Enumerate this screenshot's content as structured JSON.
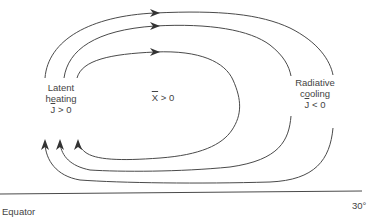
{
  "diagram": {
    "type": "meridional-circulation-schematic",
    "labels": {
      "latent": {
        "line1": "Latent",
        "line2": "heating",
        "symbol": "J",
        "relation": " > 0"
      },
      "radiative": {
        "line1": "Radiative",
        "line2": "cooling",
        "symbol": "J",
        "relation": " < 0"
      },
      "interior": {
        "symbol": "X",
        "relation": " > 0"
      }
    },
    "axis": {
      "left_label": "Equator",
      "right_label": "30°"
    },
    "loops": [
      {
        "name": "outer",
        "direction": "clockwise"
      },
      {
        "name": "middle",
        "direction": "clockwise"
      },
      {
        "name": "inner",
        "direction": "clockwise"
      }
    ],
    "colors": {
      "line": "#4a4a4a",
      "text": "#444444",
      "background": "#ffffff"
    }
  }
}
